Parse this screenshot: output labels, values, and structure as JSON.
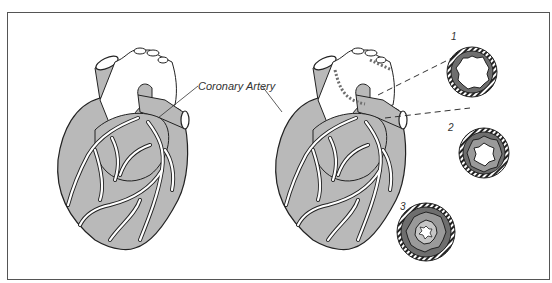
{
  "figure": {
    "labels": {
      "artery": "Coronary Artery"
    },
    "cross_sections": [
      {
        "number": "1",
        "stage": "mild plaque"
      },
      {
        "number": "2",
        "stage": "moderate plaque"
      },
      {
        "number": "3",
        "stage": "severe plaque"
      }
    ],
    "colors": {
      "heart_fill": "#b9b9b9",
      "outline": "#222222",
      "vessel": "#ffffff",
      "plaque_dark": "#6e6e6e",
      "plaque_mid": "#9a9a9a",
      "plaque_light": "#c6c6c6",
      "frame": "#555555"
    }
  }
}
